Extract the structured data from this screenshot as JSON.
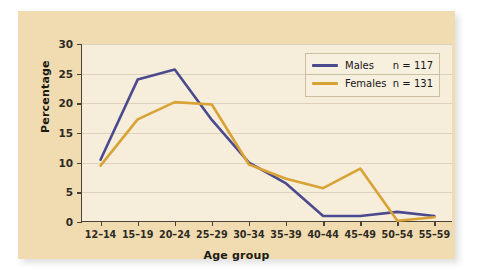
{
  "chart_data": {
    "type": "line",
    "title": "",
    "xlabel": "Age group",
    "ylabel": "Percentage",
    "categories": [
      "12–14",
      "15–19",
      "20–24",
      "25–29",
      "30–34",
      "35–39",
      "40–44",
      "45–49",
      "50–54",
      "55–59"
    ],
    "yticks": [
      0,
      5,
      10,
      15,
      20,
      25,
      30
    ],
    "ylim": [
      0,
      30
    ],
    "grid": true,
    "legend_position": "top-right",
    "series": [
      {
        "name": "Males",
        "n_label": "n = 117",
        "color": "#4c4a8f",
        "values": [
          10.5,
          24.0,
          25.7,
          17.2,
          10.0,
          6.5,
          1.0,
          1.0,
          1.7,
          1.0
        ]
      },
      {
        "name": "Females",
        "n_label": "n = 131",
        "color": "#d9a235",
        "values": [
          9.5,
          17.3,
          20.2,
          19.8,
          9.7,
          7.3,
          5.7,
          9.0,
          0.2,
          0.8
        ]
      }
    ]
  },
  "colors": {
    "panel": "#f0dcb0",
    "plot_background": "#f6eedb",
    "axis": "#4a4238",
    "gridline": "#ddd3bd",
    "males": "#4c4a8f",
    "females": "#d9a235"
  }
}
